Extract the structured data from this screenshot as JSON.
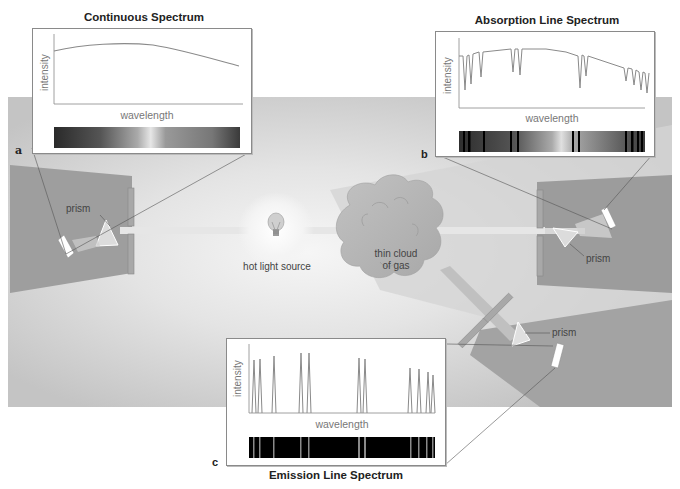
{
  "diagram": {
    "type": "spectroscopy-schematic",
    "light_source": {
      "label": "hot light source",
      "icon": "lightbulb-icon"
    },
    "gas_cloud": {
      "label_line1": "thin cloud",
      "label_line2": "of gas"
    },
    "prism_label": "prism",
    "panels": [
      {
        "id": "a",
        "letter": "a",
        "title": "Continuous Spectrum",
        "y_axis_label": "intensity",
        "x_axis_label": "wavelength",
        "curve": "smooth blackbody curve, peaks ~40% along, declines to the right"
      },
      {
        "id": "b",
        "letter": "b",
        "title": "Absorption Line Spectrum",
        "y_axis_label": "intensity",
        "x_axis_label": "wavelength",
        "curve": "blackbody curve with narrow downward absorption dips",
        "line_positions_fraction": [
          0.02,
          0.05,
          0.13,
          0.28,
          0.32,
          0.59,
          0.62,
          0.86,
          0.91,
          0.95,
          0.98
        ]
      },
      {
        "id": "c",
        "letter": "c",
        "title": "Emission Line Spectrum",
        "y_axis_label": "intensity",
        "x_axis_label": "wavelength",
        "curve": "flat zero baseline with narrow upward emission spikes",
        "line_positions_fraction": [
          0.03,
          0.06,
          0.13,
          0.28,
          0.32,
          0.59,
          0.62,
          0.86,
          0.91,
          0.95,
          0.98
        ]
      }
    ]
  },
  "colors": {
    "background_panel": "#c8c8c8",
    "dark_cone": "#9a9a9a",
    "beam": "#e2e2e2",
    "cloud": "#b5b5b5",
    "plot_line": "#8a8a8a"
  }
}
